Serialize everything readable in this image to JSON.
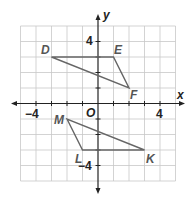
{
  "diagram": {
    "type": "coordinate-plane",
    "axes": {
      "x_label": "x",
      "y_label": "y",
      "origin_label": "O"
    },
    "tick_labels": {
      "x_neg": "−4",
      "x_pos": "4",
      "y_pos": "4",
      "y_neg": "−4"
    },
    "grid": {
      "x_min": -5,
      "x_max": 5,
      "y_min": -5,
      "y_max": 5
    },
    "triangles": [
      {
        "name": "DEF",
        "vertices": [
          {
            "label": "D",
            "x": -3,
            "y": 3
          },
          {
            "label": "E",
            "x": 1,
            "y": 3
          },
          {
            "label": "F",
            "x": 2,
            "y": 1
          }
        ]
      },
      {
        "name": "MLK",
        "vertices": [
          {
            "label": "M",
            "x": -2,
            "y": -1
          },
          {
            "label": "L",
            "x": -1,
            "y": -3
          },
          {
            "label": "K",
            "x": 3,
            "y": -3
          }
        ]
      }
    ],
    "colors": {
      "grid": "#c8c8c8",
      "axis": "#222222",
      "triangle": "#666666",
      "label": "#555555"
    }
  }
}
